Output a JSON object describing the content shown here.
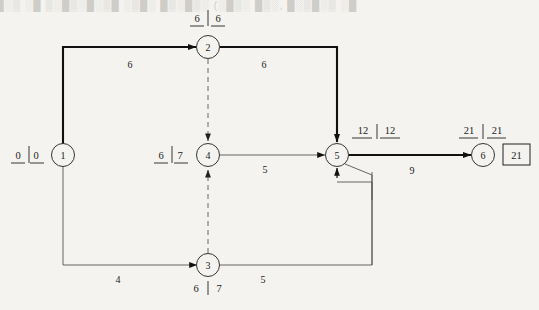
{
  "diagram": {
    "type": "activity-on-arrow network",
    "colors": {
      "background": "#f4f3f0",
      "line": "#1b1b1b",
      "critical": "#000000",
      "text": "#1b1b1b"
    },
    "nodes": [
      {
        "id": "1",
        "label": "1",
        "x": 63,
        "y": 155,
        "time_label": "0 | 0",
        "early": "0",
        "late": "0",
        "label_pos": "left"
      },
      {
        "id": "2",
        "label": "2",
        "x": 208,
        "y": 47,
        "time_label": "6 | 6",
        "early": "6",
        "late": "6",
        "label_pos": "above"
      },
      {
        "id": "3",
        "label": "3",
        "x": 208,
        "y": 265,
        "time_label": "6 | 7",
        "early": "6",
        "late": "7",
        "label_pos": "below"
      },
      {
        "id": "4",
        "label": "4",
        "x": 208,
        "y": 155,
        "time_label": "6 | 7",
        "early": "6",
        "late": "7",
        "label_pos": "left"
      },
      {
        "id": "5",
        "label": "5",
        "x": 337,
        "y": 155,
        "time_label": "12 | 12",
        "early": "12",
        "late": "12",
        "label_pos": "above-right"
      },
      {
        "id": "6",
        "label": "6",
        "x": 483,
        "y": 155,
        "time_label": "21 | 21",
        "early": "21",
        "late": "21",
        "label_pos": "above"
      }
    ],
    "edges": [
      {
        "from": "1",
        "to": "2",
        "weight": "6",
        "style": "solid",
        "critical": true,
        "wx": 130,
        "wy": 68
      },
      {
        "from": "1",
        "to": "3",
        "weight": "4",
        "style": "solid",
        "critical": false,
        "wx": 118,
        "wy": 283
      },
      {
        "from": "2",
        "to": "5",
        "weight": "6",
        "style": "solid",
        "critical": true,
        "wx": 264,
        "wy": 68
      },
      {
        "from": "2",
        "to": "4",
        "weight": "",
        "style": "dashed",
        "critical": false,
        "wx": 0,
        "wy": 0
      },
      {
        "from": "3",
        "to": "4",
        "weight": "",
        "style": "dashed",
        "critical": false,
        "wx": 0,
        "wy": 0
      },
      {
        "from": "3",
        "to": "5",
        "weight": "5",
        "style": "solid",
        "critical": false,
        "wx": 263,
        "wy": 283
      },
      {
        "from": "4",
        "to": "5",
        "weight": "5",
        "style": "solid",
        "critical": false,
        "wx": 265,
        "wy": 173
      },
      {
        "from": "5",
        "to": "6",
        "weight": "9",
        "style": "solid",
        "critical": true,
        "wx": 412,
        "wy": 174
      }
    ],
    "project_duration_box": {
      "value": "21",
      "x": 516,
      "y": 155
    },
    "bleed_text": "█░▒ ░█ ▒░█▒░█░▒█  ░▒█░  █▒░█▒░  (░█▒░ █▒░, █░▒█░▒ ░█"
  }
}
